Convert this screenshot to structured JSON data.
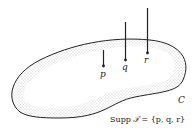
{
  "diagram": {
    "region_label": "C",
    "points": [
      {
        "label": "p"
      },
      {
        "label": "q"
      },
      {
        "label": "r"
      }
    ],
    "caption": {
      "prefix": "Supp",
      "symbol": "𝒯",
      "rest": " = {p, q, r}"
    },
    "colors": {
      "stroke": "#222222",
      "stipple": "#9a9a9a"
    }
  }
}
